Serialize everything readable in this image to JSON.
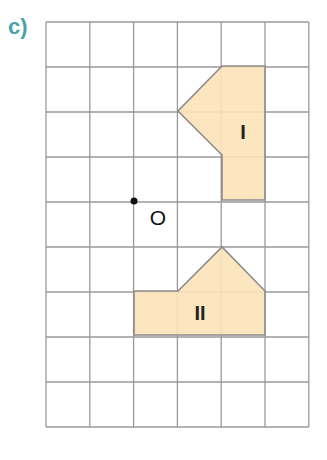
{
  "part_label": "c)",
  "grid": {
    "columns": 6,
    "rows": 9,
    "x0": 46,
    "y0": 22,
    "cell_w": 43.8,
    "cell_h": 45,
    "line_color": "#9a9a9a"
  },
  "point": {
    "label": "O",
    "x": 134,
    "y": 201,
    "label_x": 158,
    "label_y": 225
  },
  "shapes": [
    {
      "label": "I",
      "fill": "#fbe3b8",
      "stroke": "#8c8c8c",
      "points": "222,66 265,66 265,200 222,200 222,155 178,111",
      "label_x": 243,
      "label_y": 139
    },
    {
      "label": "II",
      "fill": "#fbe3b8",
      "stroke": "#8c8c8c",
      "points": "134,291 178,291 222,247 265,291 265,335 134,335",
      "label_x": 200,
      "label_y": 320
    }
  ]
}
